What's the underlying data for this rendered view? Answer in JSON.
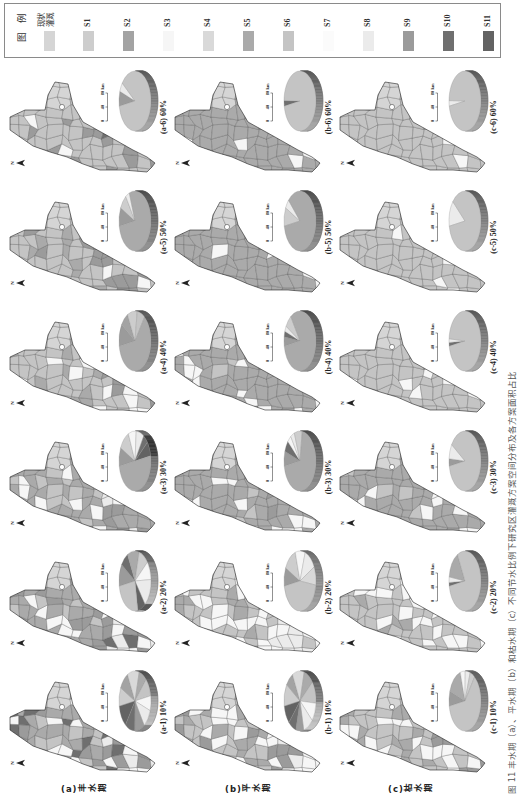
{
  "figure": {
    "caption": "图 11 丰水期（a）、平水期（b）和枯水期（c）不同节水比例下研究区灌溉方案空间分布及各方案面积占比",
    "rows": [
      {
        "id": "a",
        "label": "(a)丰水期"
      },
      {
        "id": "b",
        "label": "(b)平水期"
      },
      {
        "id": "c",
        "label": "(c)枯水期"
      }
    ],
    "columns": [
      "10%",
      "20%",
      "30%",
      "40%",
      "50%",
      "60%"
    ],
    "north_label": "N",
    "scale_bar": {
      "ticks": [
        "0",
        "40",
        "80"
      ],
      "unit": "km"
    },
    "blob_scheme": "现状灌溉"
  },
  "legend": {
    "title": "图例",
    "items": [
      {
        "code": "现状灌溉",
        "label": "现状灌溉",
        "color": "#d5d5d5"
      },
      {
        "code": "S1",
        "label": "S1",
        "color": "#cdcdcd"
      },
      {
        "code": "S2",
        "label": "S2",
        "color": "#a3a3a3"
      },
      {
        "code": "S3",
        "label": "S3",
        "color": "#f6f6f6"
      },
      {
        "code": "S4",
        "label": "S4",
        "color": "#d9d9d9"
      },
      {
        "code": "S5",
        "label": "S5",
        "color": "#aaaaaa"
      },
      {
        "code": "S6",
        "label": "S6",
        "color": "#c4c4c4"
      },
      {
        "code": "S7",
        "label": "S7",
        "color": "#fbfbfb"
      },
      {
        "code": "S8",
        "label": "S8",
        "color": "#ebebeb"
      },
      {
        "code": "S9",
        "label": "S9",
        "color": "#9b9b9b"
      },
      {
        "code": "S10",
        "label": "S10",
        "color": "#6f6f6f"
      },
      {
        "code": "S11",
        "label": "S11",
        "color": "#636363"
      }
    ]
  },
  "panels": [
    {
      "id": "a-1",
      "label": "(a-1) 10%",
      "map_main": [
        [
          "S5",
          35
        ],
        [
          "S9",
          20
        ],
        [
          "S6",
          20
        ],
        [
          "S3",
          15
        ],
        [
          "S10",
          10
        ]
      ],
      "map_tail": [
        [
          "S3",
          35
        ],
        [
          "S8",
          25
        ],
        [
          "S9",
          20
        ],
        [
          "S10",
          20
        ]
      ]
    },
    {
      "id": "a-2",
      "label": "(a-2) 20%",
      "map_main": [
        [
          "S5",
          40
        ],
        [
          "S9",
          25
        ],
        [
          "S3",
          20
        ],
        [
          "S6",
          15
        ]
      ],
      "map_tail": [
        [
          "S3",
          40
        ],
        [
          "S8",
          20
        ],
        [
          "S9",
          20
        ],
        [
          "S10",
          20
        ]
      ]
    },
    {
      "id": "a-3",
      "label": "(a-3) 30%",
      "map_main": [
        [
          "S5",
          60
        ],
        [
          "S6",
          20
        ],
        [
          "S3",
          20
        ]
      ],
      "map_tail": [
        [
          "S3",
          30
        ],
        [
          "S8",
          20
        ],
        [
          "S5",
          30
        ],
        [
          "S9",
          20
        ]
      ]
    },
    {
      "id": "a-4",
      "label": "(a-4) 40%",
      "map_main": [
        [
          "S6",
          70
        ],
        [
          "S5",
          20
        ],
        [
          "S3",
          10
        ]
      ],
      "map_tail": [
        [
          "S9",
          30
        ],
        [
          "S6",
          40
        ],
        [
          "S3",
          30
        ]
      ]
    },
    {
      "id": "a-5",
      "label": "(a-5) 50%",
      "map_main": [
        [
          "S6",
          75
        ],
        [
          "S5",
          15
        ],
        [
          "S9",
          10
        ]
      ],
      "map_tail": [
        [
          "S9",
          40
        ],
        [
          "S6",
          50
        ],
        [
          "S3",
          10
        ]
      ]
    },
    {
      "id": "a-6",
      "label": "(a-6) 60%",
      "map_main": [
        [
          "S6",
          85
        ],
        [
          "S9",
          10
        ],
        [
          "S3",
          5
        ]
      ],
      "map_tail": [
        [
          "S6",
          60
        ],
        [
          "S9",
          30
        ],
        [
          "S10",
          10
        ]
      ]
    },
    {
      "id": "b-1",
      "label": "(b-1) 10%",
      "map_main": [
        [
          "S6",
          40
        ],
        [
          "S5",
          30
        ],
        [
          "S3",
          20
        ],
        [
          "S9",
          10
        ]
      ],
      "map_tail": [
        [
          "S3",
          40
        ],
        [
          "S8",
          30
        ],
        [
          "S9",
          30
        ]
      ]
    },
    {
      "id": "b-2",
      "label": "(b-2) 20%",
      "map_main": [
        [
          "S6",
          50
        ],
        [
          "S3",
          30
        ],
        [
          "S5",
          20
        ]
      ],
      "map_tail": [
        [
          "S3",
          40
        ],
        [
          "S8",
          30
        ],
        [
          "S6",
          30
        ]
      ]
    },
    {
      "id": "b-3",
      "label": "(b-3) 30%",
      "map_main": [
        [
          "S5",
          80
        ],
        [
          "S3",
          10
        ],
        [
          "S6",
          10
        ]
      ],
      "map_tail": [
        [
          "S5",
          50
        ],
        [
          "S3",
          30
        ],
        [
          "S9",
          20
        ]
      ]
    },
    {
      "id": "b-4",
      "label": "(b-4) 40%",
      "map_main": [
        [
          "S5",
          85
        ],
        [
          "S3",
          10
        ],
        [
          "S6",
          5
        ]
      ],
      "map_tail": [
        [
          "S5",
          80
        ],
        [
          "S3",
          20
        ]
      ]
    },
    {
      "id": "b-5",
      "label": "(b-5) 50%",
      "map_main": [
        [
          "S5",
          90
        ],
        [
          "S3",
          10
        ]
      ],
      "map_tail": [
        [
          "S5",
          85
        ],
        [
          "S3",
          15
        ]
      ]
    },
    {
      "id": "b-6",
      "label": "(b-6) 60%",
      "map_main": [
        [
          "S5",
          95
        ],
        [
          "S3",
          5
        ]
      ],
      "map_tail": [
        [
          "S5",
          90
        ],
        [
          "S3",
          10
        ]
      ]
    },
    {
      "id": "c-1",
      "label": "(c-1) 10%",
      "map_main": [
        [
          "S6",
          50
        ],
        [
          "S5",
          25
        ],
        [
          "S3",
          25
        ]
      ],
      "map_tail": [
        [
          "S3",
          40
        ],
        [
          "S6",
          40
        ],
        [
          "S9",
          20
        ]
      ]
    },
    {
      "id": "c-2",
      "label": "(c-2) 20%",
      "map_main": [
        [
          "S6",
          60
        ],
        [
          "S3",
          25
        ],
        [
          "S5",
          15
        ]
      ],
      "map_tail": [
        [
          "S3",
          40
        ],
        [
          "S6",
          50
        ],
        [
          "S8",
          10
        ]
      ]
    },
    {
      "id": "c-3",
      "label": "(c-3) 30%",
      "map_main": [
        [
          "S5",
          70
        ],
        [
          "S6",
          20
        ],
        [
          "S3",
          10
        ]
      ],
      "map_tail": [
        [
          "S5",
          60
        ],
        [
          "S3",
          30
        ],
        [
          "S9",
          10
        ]
      ]
    },
    {
      "id": "c-4",
      "label": "(c-4) 40%",
      "map_main": [
        [
          "S6",
          85
        ],
        [
          "S3",
          15
        ]
      ],
      "map_tail": [
        [
          "S6",
          80
        ],
        [
          "S3",
          20
        ]
      ]
    },
    {
      "id": "c-5",
      "label": "(c-5) 50%",
      "map_main": [
        [
          "S6",
          90
        ],
        [
          "S3",
          10
        ]
      ],
      "map_tail": [
        [
          "S6",
          85
        ],
        [
          "S3",
          15
        ]
      ]
    },
    {
      "id": "c-6",
      "label": "(c-6) 60%",
      "map_main": [
        [
          "S6",
          92
        ],
        [
          "S3",
          8
        ]
      ],
      "map_tail": [
        [
          "S6",
          90
        ],
        [
          "S3",
          10
        ]
      ]
    }
  ],
  "chart_data": [
    {
      "type": "pie",
      "title": "(a-1) 10%",
      "categories": [
        "S1",
        "S2",
        "S4",
        "S5",
        "S6",
        "S3",
        "S8",
        "S9",
        "S10",
        "S11"
      ],
      "values": [
        10,
        10,
        12,
        8,
        10,
        8,
        10,
        10,
        10,
        12
      ]
    },
    {
      "type": "pie",
      "title": "(a-2) 20%",
      "categories": [
        "S9",
        "S10",
        "S5",
        "S1",
        "S3",
        "S8",
        "S11",
        "S6"
      ],
      "values": [
        12,
        8,
        12,
        10,
        10,
        15,
        8,
        25
      ]
    },
    {
      "type": "pie",
      "title": "(a-3) 30%",
      "categories": [
        "S9",
        "S1",
        "S3",
        "S8",
        "S10",
        "S11",
        "S5"
      ],
      "values": [
        10,
        11,
        8,
        8,
        5,
        8,
        50
      ]
    },
    {
      "type": "pie",
      "title": "(a-4) 40%",
      "categories": [
        "S9",
        "S2",
        "S1",
        "S6",
        "S5"
      ],
      "values": [
        12,
        8,
        10,
        8,
        62
      ]
    },
    {
      "type": "pie",
      "title": "(a-5) 50%",
      "categories": [
        "S9",
        "S1",
        "S8",
        "S5"
      ],
      "values": [
        10,
        8,
        4,
        78
      ]
    },
    {
      "type": "pie",
      "title": "(a-6) 60%",
      "categories": [
        "S9",
        "S8",
        "S6"
      ],
      "values": [
        8,
        5,
        87
      ]
    },
    {
      "type": "pie",
      "title": "(b-1) 10%",
      "categories": [
        "S1",
        "S2",
        "S4",
        "S5",
        "S6",
        "S3",
        "S8",
        "S9",
        "S10",
        "S11"
      ],
      "values": [
        12,
        8,
        12,
        10,
        12,
        10,
        10,
        8,
        8,
        10
      ]
    },
    {
      "type": "pie",
      "title": "(b-2) 20%",
      "categories": [
        "S9",
        "S1",
        "S3",
        "S8",
        "S4",
        "S6"
      ],
      "values": [
        10,
        13,
        10,
        12,
        10,
        45
      ]
    },
    {
      "type": "pie",
      "title": "(b-3) 30%",
      "categories": [
        "S9",
        "S10",
        "S3",
        "S8",
        "S1",
        "S5"
      ],
      "values": [
        8,
        6,
        4,
        4,
        8,
        70
      ]
    },
    {
      "type": "pie",
      "title": "(b-4) 40%",
      "categories": [
        "S9",
        "S10",
        "S8",
        "S1",
        "S5"
      ],
      "values": [
        5,
        3,
        3,
        7,
        82
      ]
    },
    {
      "type": "pie",
      "title": "(b-5) 50%",
      "categories": [
        "S1",
        "S8",
        "S5"
      ],
      "values": [
        10,
        5,
        85
      ]
    },
    {
      "type": "pie",
      "title": "(b-6) 60%",
      "categories": [
        "S10",
        "S6"
      ],
      "values": [
        3,
        97
      ]
    },
    {
      "type": "pie",
      "title": "(c-1) 10%",
      "categories": [
        "S9",
        "S5",
        "S3",
        "S8",
        "S1",
        "S6"
      ],
      "values": [
        8,
        15,
        5,
        5,
        5,
        62
      ]
    },
    {
      "type": "pie",
      "title": "(c-2) 20%",
      "categories": [
        "S10",
        "S8",
        "S5",
        "S6"
      ],
      "values": [
        2,
        3,
        15,
        80
      ]
    },
    {
      "type": "pie",
      "title": "(c-3) 30%",
      "categories": [
        "S9",
        "S8",
        "S6"
      ],
      "values": [
        4,
        8,
        88
      ]
    },
    {
      "type": "pie",
      "title": "(c-4) 40%",
      "categories": [
        "S10",
        "S8",
        "S6"
      ],
      "values": [
        2,
        2,
        96
      ]
    },
    {
      "type": "pie",
      "title": "(c-5) 50%",
      "categories": [
        "S8",
        "S6"
      ],
      "values": [
        14,
        86
      ]
    },
    {
      "type": "pie",
      "title": "(c-6) 60%",
      "categories": [
        "S8",
        "S6"
      ],
      "values": [
        3,
        97
      ]
    }
  ]
}
